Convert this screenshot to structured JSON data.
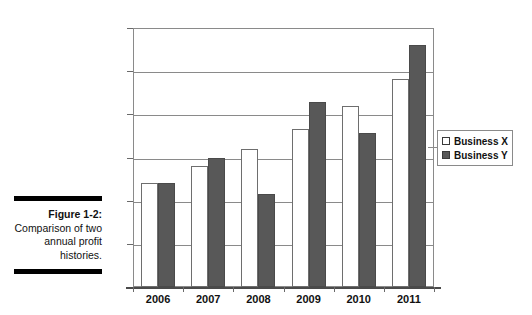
{
  "figure": {
    "caption_title": "Figure 1-2:",
    "caption_body": "Comparison of two annual profit histories."
  },
  "legend": {
    "position": "right-middle",
    "entries": [
      {
        "label": "Business X",
        "swatch": "hollow-square-icon",
        "color": "#ffffff"
      },
      {
        "label": "Business Y",
        "swatch": "filled-square-icon",
        "color": "#585858"
      }
    ]
  },
  "chart_data": {
    "type": "bar",
    "title": "",
    "xlabel": "",
    "ylabel": "",
    "categories": [
      "2006",
      "2007",
      "2008",
      "2009",
      "2010",
      "2011"
    ],
    "series": [
      {
        "name": "Business X",
        "color": "#ffffff",
        "values": [
          120000,
          140000,
          160000,
          183000,
          210000,
          241000
        ]
      },
      {
        "name": "Business Y",
        "color": "#585858",
        "values": [
          120000,
          150000,
          108000,
          214000,
          178000,
          280000
        ]
      }
    ],
    "ylim": [
      0,
      300000
    ],
    "ytick_values": [
      0,
      50000,
      100000,
      150000,
      200000,
      250000,
      300000
    ],
    "ytick_labels": [
      "£0",
      "£50,000",
      "£100,000",
      "£150,000",
      "£200,000",
      "£250,000",
      "£300,000"
    ],
    "currency_symbol": "£",
    "grid": true,
    "legend_position": "right"
  }
}
